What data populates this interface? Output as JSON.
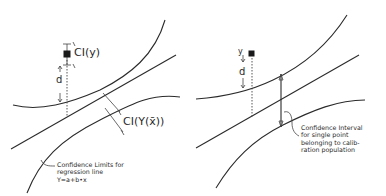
{
  "left_panel": {
    "ci_y_label": "CI(y)",
    "d_label": "d",
    "ci_Yx_label": "CI(Y(x̄))",
    "confidence_limits_caption": [
      "Confidence Limits for",
      "regression line",
      "Y=a+b•x"
    ]
  },
  "right_panel": {
    "y_label": "y",
    "d_label": "d",
    "confidence_interval_caption": [
      "Confidence Interval",
      "for single point",
      "belonging to calib-",
      "ration population"
    ]
  },
  "colors": {
    "line": "#2a2a2a",
    "background": "#ffffff"
  }
}
